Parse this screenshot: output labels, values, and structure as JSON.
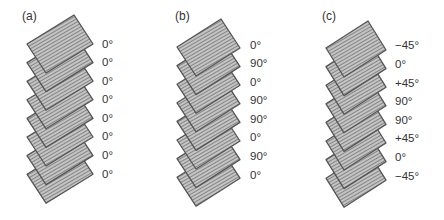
{
  "panels": [
    {
      "id": "a",
      "heading": "(a)",
      "plies": [
        "0°",
        "0°",
        "0°",
        "0°",
        "0°",
        "0°",
        "0°",
        "0°"
      ]
    },
    {
      "id": "b",
      "heading": "(b)",
      "plies": [
        "0°",
        "90°",
        "0°",
        "90°",
        "90°",
        "0°",
        "90°",
        "0°"
      ]
    },
    {
      "id": "c",
      "heading": "(c)",
      "plies": [
        "−45°",
        "0°",
        "+45°",
        "90°",
        "90°",
        "+45°",
        "0°",
        "−45°"
      ]
    }
  ],
  "colors": {
    "ply_fill": "#b8b8b8",
    "ply_hatch": "#8a8a8a",
    "ply_edge": "#555555",
    "text": "#333333"
  }
}
